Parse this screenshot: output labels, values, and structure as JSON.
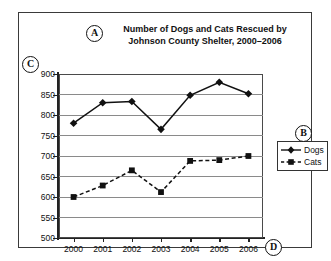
{
  "annotations": {
    "a": "A",
    "b": "B",
    "c": "C",
    "d": "D"
  },
  "title_line1": "Number of Dogs and Cats Rescued by",
  "title_line2": "Johnson County Shelter, 2000–2006",
  "legend": {
    "dogs": "Dogs",
    "cats": "Cats"
  },
  "colors": {
    "series": "#111111",
    "gridline": "#8a8a8a",
    "frame": "#4a4a4a",
    "axis": "#222222",
    "background": "#ffffff"
  },
  "chart_data": {
    "type": "line",
    "title": "Number of Dogs and Cats Rescued by Johnson County Shelter, 2000–2006",
    "xlabel": "",
    "ylabel": "",
    "categories": [
      "2000",
      "2001",
      "2002",
      "2003",
      "2004",
      "2005",
      "2006"
    ],
    "x": [
      2000,
      2001,
      2002,
      2003,
      2004,
      2005,
      2006
    ],
    "series": [
      {
        "name": "Dogs",
        "marker": "diamond",
        "linestyle": "solid",
        "values": [
          780,
          830,
          833,
          765,
          848,
          880,
          852
        ]
      },
      {
        "name": "Cats",
        "marker": "square",
        "linestyle": "dashed",
        "values": [
          600,
          628,
          665,
          612,
          688,
          690,
          700
        ]
      }
    ],
    "ylim": [
      500,
      900
    ],
    "yticks": [
      500,
      550,
      600,
      650,
      700,
      750,
      800,
      850,
      900
    ],
    "ytick_labels": [
      "500",
      "550",
      "600",
      "650",
      "700",
      "750",
      "800",
      "850",
      "900"
    ],
    "grid": true,
    "legend_position": "right"
  }
}
